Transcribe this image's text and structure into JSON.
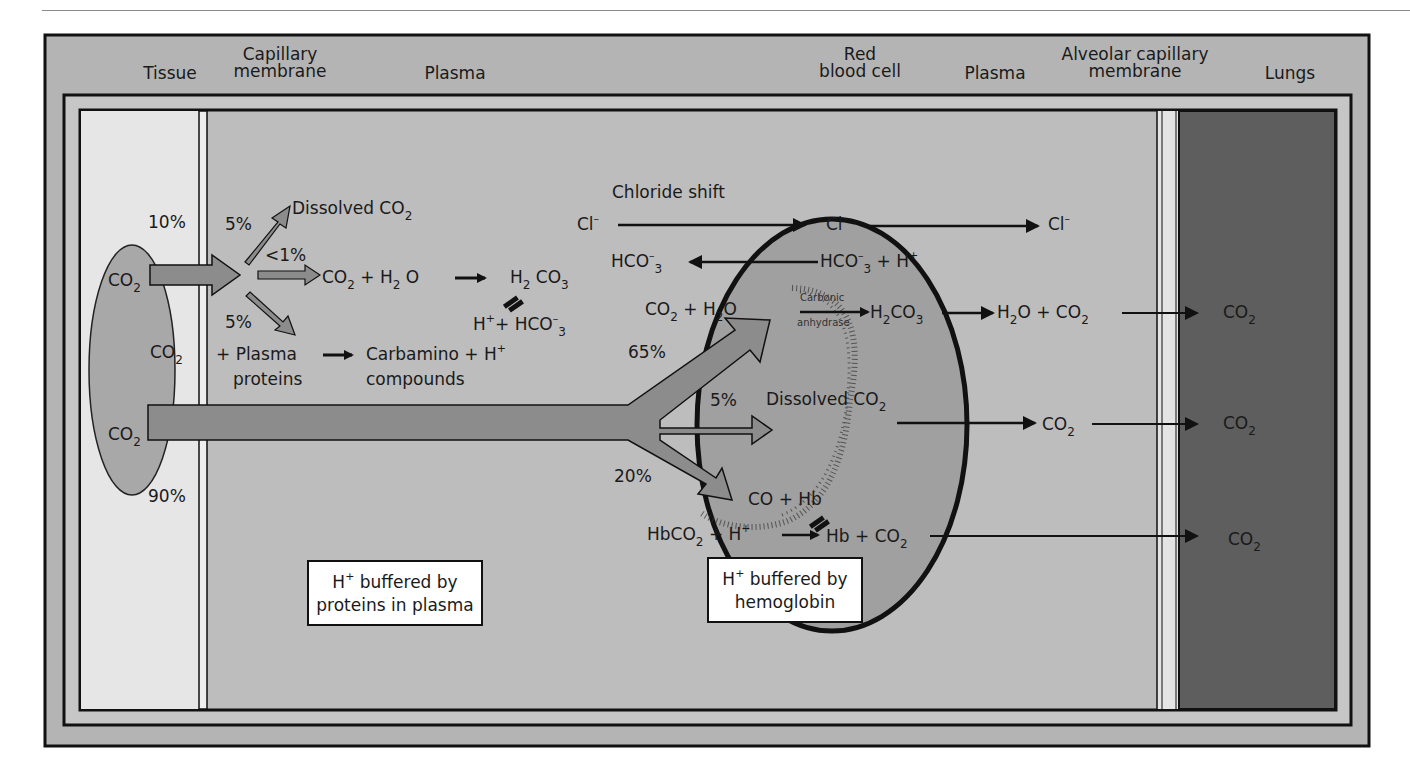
{
  "headers": {
    "tissue": "Tissue",
    "capillary_membrane_1": "Capillary",
    "capillary_membrane_2": "membrane",
    "plasma_left": "Plasma",
    "rbc_1": "Red",
    "rbc_2": "blood cell",
    "plasma_right": "Plasma",
    "alveolar_1": "Alveolar capillary",
    "alveolar_2": "membrane",
    "lungs": "Lungs"
  },
  "tissue": {
    "co2_a": "CO",
    "co2_b": "CO",
    "co2_c": "CO",
    "sub2": "2",
    "pct_10": "10%",
    "pct_90": "90%"
  },
  "plasma_left": {
    "pct_5_top": "5%",
    "dissolved": "Dissolved CO",
    "pct_lt1": "<1%",
    "co2_h2o_co2": "CO",
    "co2_h2o_plus": "+ H",
    "co2_h2o_o": "O",
    "h2co3_h": "H",
    "h2co3_co": "CO",
    "sub3": "3",
    "h_plus_hco3": "H",
    "h_plus_hco3_rest": "+ HCO",
    "pct_5_bottom": "5%",
    "plus_plasma": "+ Plasma",
    "proteins": "proteins",
    "carbamino": "Carbamino + H",
    "compounds": "compounds",
    "plus": "+",
    "minus": "–"
  },
  "chloride": {
    "title": "Chloride shift",
    "cl_left": "Cl",
    "cl_mid": "Cl",
    "cl_right": "Cl",
    "hco3_left": "HCO",
    "hco3_mid": "HCO",
    "hco3_mid_rest": "+ H"
  },
  "rbc": {
    "co2_h2o_co": "CO",
    "co2_h2o_plus": "+ H",
    "co2_h2o_o": "O",
    "carbonic": "Carbonic",
    "anhydrase": "anhydrase",
    "h2co3_h": "H",
    "h2co3_co": "CO",
    "pct_65": "65%",
    "pct_5": "5%",
    "dissolved": "Dissolved CO",
    "pct_20": "20%",
    "co_hb": "CO + Hb",
    "hbco2": "HbCO",
    "hbco2_rest": "+ H",
    "hb_co2": "Hb + CO"
  },
  "plasma_right": {
    "h2o_co2_h": "H",
    "h2o_co2_rest": "O + CO",
    "co2": "CO"
  },
  "lungs": {
    "co2_1": "CO",
    "co2_2": "CO",
    "co2_3": "CO"
  },
  "boxes": {
    "plasma_line1": "H",
    "plasma_line1_rest": " buffered by",
    "plasma_line2": "proteins in plasma",
    "hb_line1": "H",
    "hb_line1_rest": " buffered by",
    "hb_line2": "hemoglobin"
  },
  "colors": {
    "outer_frame": "#b4b4b4",
    "tissue": "#e6e6e6",
    "plasma": "#bdbdbd",
    "rbc": "#a0a0a0",
    "lungs": "#5e5e5e",
    "arrow_fill": "#8c8c8c",
    "ink": "#1a1a1a"
  }
}
